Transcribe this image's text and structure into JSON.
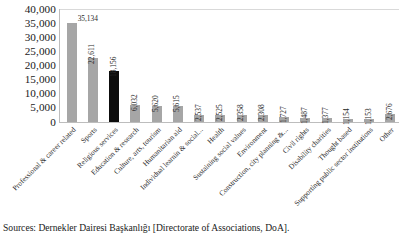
{
  "chart_data": {
    "type": "bar",
    "title": "",
    "subtitle": "",
    "xlabel": "",
    "ylabel": "",
    "ylim": [
      0,
      40000
    ],
    "ytick_labels": [
      "40,000",
      "35,000",
      "30,000",
      "25,000",
      "20,000",
      "15,000",
      "10,000",
      "5,000",
      "0"
    ],
    "ytick_values": [
      40000,
      35000,
      30000,
      25000,
      20000,
      15000,
      10000,
      5000,
      0
    ],
    "grid": "top-line-only",
    "legend": "none",
    "categories": [
      "Professional & career related",
      "Sports",
      "Religious services",
      "Education & research",
      "Culture, arts, tourism",
      "Humanitarian aid",
      "Individual learnin & social...",
      "Health",
      "Sustaining social values",
      "Environment",
      "Construction, city planning &...",
      "Civil rights",
      "Disability charities",
      "Thought based",
      "Supporting public sector institutions",
      "Other"
    ],
    "values": [
      35134,
      22611,
      18156,
      6032,
      5620,
      5615,
      2537,
      2525,
      2358,
      2308,
      1727,
      1487,
      1377,
      1154,
      1153,
      2676
    ],
    "value_labels": [
      "35,134",
      "22,611",
      "18,156",
      "6,032",
      "5,620",
      "5,615",
      "2,537",
      "2,525",
      "2,358",
      "2,308",
      "1,727",
      "1,487",
      "1,377",
      "1,154",
      "1,153",
      "2,676"
    ],
    "bar_colors": [
      "#a6a6a6",
      "#a6a6a6",
      "#0d0d0d",
      "#a6a6a6",
      "#a6a6a6",
      "#a6a6a6",
      "#a6a6a6",
      "#a6a6a6",
      "#a6a6a6",
      "#a6a6a6",
      "#a6a6a6",
      "#a6a6a6",
      "#a6a6a6",
      "#a6a6a6",
      "#a6a6a6",
      "#a6a6a6"
    ],
    "highlight_index": 2,
    "colors": {
      "bar_default": "#a6a6a6",
      "bar_highlight": "#0d0d0d",
      "gridline": "#d9d9d9",
      "axis": "#bdbdbd",
      "text": "#1a1a1a",
      "background": "#ffffff"
    }
  },
  "source_note": "Sources: Dernekler Dairesi Başkanlığı [Directorate of Associations, DoA]."
}
